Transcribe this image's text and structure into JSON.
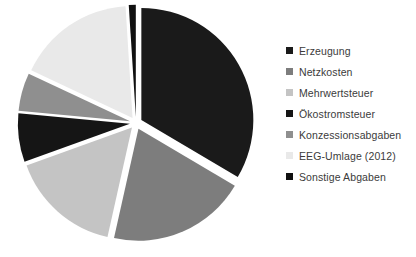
{
  "chart_data": {
    "type": "pie",
    "title": "",
    "subtitle": "",
    "xlabel": "",
    "ylabel": "",
    "legend_position": "right",
    "grid": false,
    "exploded": true,
    "start_angle_deg": 0,
    "categories": [
      "Erzeugung",
      "Netzkosten",
      "Mehrwertsteuer",
      "Ökostromsteuer",
      "Konzessionsabgaben",
      "EEG-Umlage (2012)",
      "Sonstige Abgaben"
    ],
    "values": [
      33.5,
      20.0,
      16.0,
      7.0,
      5.5,
      17.0,
      1.0
    ],
    "colors": [
      "#1a1a1a",
      "#7d7d7d",
      "#c4c4c4",
      "#151515",
      "#8f8f8f",
      "#e9e9e9",
      "#101010"
    ],
    "slices": [
      {
        "label": "Erzeugung",
        "value": 33.5,
        "color": "#1a1a1a",
        "explode": 0.055
      },
      {
        "label": "Netzkosten",
        "value": 20.0,
        "color": "#7d7d7d",
        "explode": 0.055
      },
      {
        "label": "Mehrwertsteuer",
        "value": 16.0,
        "color": "#c4c4c4",
        "explode": 0.055
      },
      {
        "label": "Ökostromsteuer",
        "value": 7.0,
        "color": "#151515",
        "explode": 0.055
      },
      {
        "label": "Konzessionsabgaben",
        "value": 5.5,
        "color": "#8f8f8f",
        "explode": 0.055
      },
      {
        "label": "EEG-Umlage (2012)",
        "value": 17.0,
        "color": "#e9e9e9",
        "explode": 0.055
      },
      {
        "label": "Sonstige Abgaben",
        "value": 1.0,
        "color": "#101010",
        "explode": 0.055
      }
    ],
    "geometry": {
      "center_x": 136,
      "center_y": 123,
      "radius": 112
    }
  },
  "legend": {
    "items": [
      {
        "label": "Erzeugung",
        "color": "#1a1a1a"
      },
      {
        "label": "Netzkosten",
        "color": "#7d7d7d"
      },
      {
        "label": "Mehrwertsteuer",
        "color": "#c4c4c4"
      },
      {
        "label": "Ökostromsteuer",
        "color": "#151515"
      },
      {
        "label": "Konzessionsabgaben",
        "color": "#8f8f8f"
      },
      {
        "label": "EEG-Umlage (2012)",
        "color": "#e9e9e9"
      },
      {
        "label": "Sonstige Abgaben",
        "color": "#101010"
      }
    ]
  },
  "page": {
    "background_color": "#ffffff"
  }
}
